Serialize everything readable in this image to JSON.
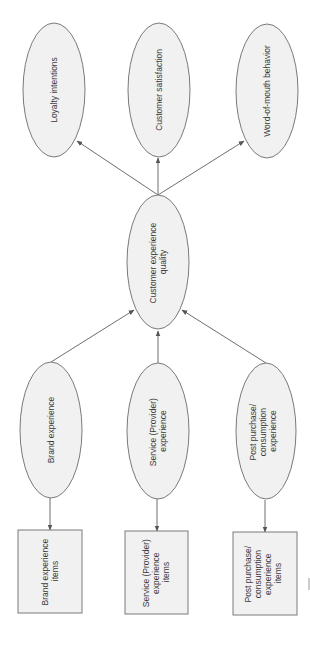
{
  "diagram": {
    "title": "",
    "orientation": "rotated-90-ccw",
    "colors": {
      "node_fill": "#f1f1f1",
      "node_stroke": "#7a7a7a",
      "edge": "#6e6e6e",
      "text": "#3a3a3a"
    },
    "outcomes": [
      {
        "id": "loyalty",
        "lines": [
          "Loyalty intentions"
        ]
      },
      {
        "id": "satisfaction",
        "lines": [
          "Customer satisfaction"
        ]
      },
      {
        "id": "wom",
        "lines": [
          "Word-of-mouth behavior"
        ]
      }
    ],
    "central": {
      "id": "cxq",
      "lines": [
        "Customer experience",
        "quality"
      ]
    },
    "dimensions": [
      {
        "id": "brand",
        "lines": [
          "Brand experience"
        ]
      },
      {
        "id": "service",
        "lines": [
          "Service (Provider)",
          "experience"
        ]
      },
      {
        "id": "post",
        "lines": [
          "Post purchase/",
          "consumption",
          "experience"
        ]
      }
    ],
    "items": [
      {
        "id": "brand_items",
        "lines": [
          "Brand experience",
          "items"
        ]
      },
      {
        "id": "service_items",
        "lines": [
          "Service (Provider)",
          "experience",
          "items"
        ]
      },
      {
        "id": "post_items",
        "lines": [
          "Post purchase/",
          "consumption",
          "experience",
          "items"
        ]
      }
    ],
    "edges": [
      {
        "from": "cxq",
        "to": "loyalty"
      },
      {
        "from": "cxq",
        "to": "satisfaction"
      },
      {
        "from": "cxq",
        "to": "wom"
      },
      {
        "from": "brand",
        "to": "cxq"
      },
      {
        "from": "service",
        "to": "cxq"
      },
      {
        "from": "post",
        "to": "cxq"
      },
      {
        "from": "brand",
        "to": "brand_items"
      },
      {
        "from": "service",
        "to": "service_items"
      },
      {
        "from": "post",
        "to": "post_items"
      }
    ]
  }
}
